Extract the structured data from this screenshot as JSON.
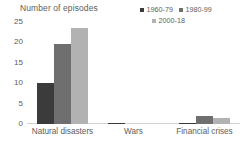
{
  "chart_data": {
    "type": "bar",
    "title": "Number of episodes",
    "xlabel": "",
    "ylabel": "Number of episodes",
    "ylim": [
      0,
      25
    ],
    "yticks": [
      0,
      5,
      10,
      15,
      20,
      25
    ],
    "grid": false,
    "legend_position": "top-right",
    "categories": [
      "Natural disasters",
      "Wars",
      "Financial crises"
    ],
    "series": [
      {
        "name": "1960-79",
        "color": "#3b3b3b",
        "values": [
          10,
          0.2,
          0.2
        ]
      },
      {
        "name": "1980-99",
        "color": "#6f6f6f",
        "values": [
          19.5,
          0,
          2
        ]
      },
      {
        "name": "2000-18",
        "color": "#b2b2b2",
        "values": [
          23.5,
          0,
          1.5
        ]
      }
    ]
  },
  "legend": {
    "items": [
      {
        "label": "1960-79",
        "color": "#3b3b3b"
      },
      {
        "label": "1980-99",
        "color": "#6f6f6f"
      },
      {
        "label": "2000-18",
        "color": "#b2b2b2"
      }
    ]
  },
  "yticks": [
    {
      "label": "25"
    },
    {
      "label": "20"
    },
    {
      "label": "15"
    },
    {
      "label": "10"
    },
    {
      "label": "5"
    },
    {
      "label": "0"
    }
  ]
}
